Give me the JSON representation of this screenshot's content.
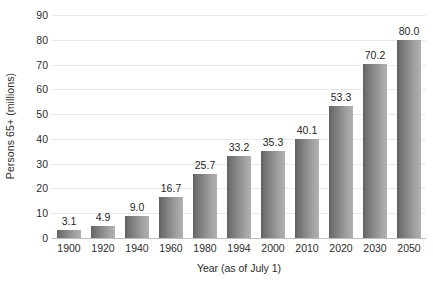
{
  "chart_data": {
    "type": "bar",
    "title": "",
    "subtitle": "",
    "xlabel": "Year (as of July 1)",
    "ylabel": "Persons 65+ (millions)",
    "categories": [
      "1900",
      "1920",
      "1940",
      "1960",
      "1980",
      "1994",
      "2000",
      "2010",
      "2020",
      "2030",
      "2050"
    ],
    "values": [
      3.1,
      4.9,
      9.0,
      16.7,
      25.7,
      33.2,
      35.3,
      40.1,
      53.3,
      70.2,
      80.0
    ],
    "value_labels": [
      "3.1",
      "4.9",
      "9.0",
      "16.7",
      "25.7",
      "33.2",
      "35.3",
      "40.1",
      "53.3",
      "70.2",
      "80.0"
    ],
    "ylim": [
      0,
      90
    ],
    "ytick_values": [
      0,
      10,
      20,
      30,
      40,
      50,
      60,
      70,
      80,
      90
    ],
    "ytick_labels": [
      "0",
      "10",
      "20",
      "30",
      "40",
      "50",
      "60",
      "70",
      "80",
      "90"
    ],
    "grid": true,
    "grid_axis": "y",
    "legend": false,
    "legend_position": "none",
    "bar_fill_dark": "#5f5f5f",
    "bar_fill_light": "#b0b0b0",
    "gridline_color": "#e9e9e9",
    "axis_color": "#bdbdbd",
    "text_color": "#2b2b2b",
    "background_color": "#ffffff"
  }
}
